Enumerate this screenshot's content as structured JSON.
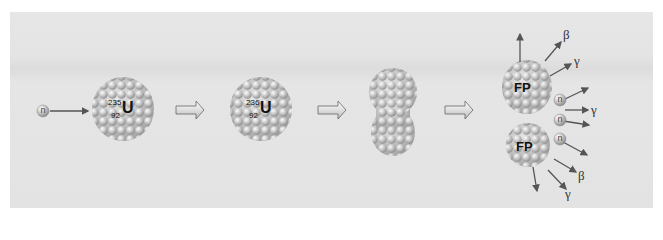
{
  "diagram": {
    "stages": [
      {
        "id": "neutron-capture",
        "incoming_particle": "n",
        "nucleus_symbol": "U",
        "mass_number": "235",
        "atomic_number": "92"
      },
      {
        "id": "compound-nucleus",
        "nucleus_symbol": "U",
        "mass_number": "236",
        "atomic_number": "92"
      },
      {
        "id": "deformed-nucleus"
      },
      {
        "id": "fission-products",
        "fragments": [
          "FP",
          "FP"
        ],
        "emissions": [
          "β",
          "γ",
          "n",
          "γ",
          "n",
          "n",
          "β",
          "γ"
        ]
      }
    ],
    "labels": {
      "neutron": "n",
      "fission_product": "FP",
      "beta": "β",
      "gamma": "γ"
    },
    "colors": {
      "background": "#e3e3e3",
      "sphere": "#c8c8c8",
      "arrow": "#555555"
    }
  }
}
